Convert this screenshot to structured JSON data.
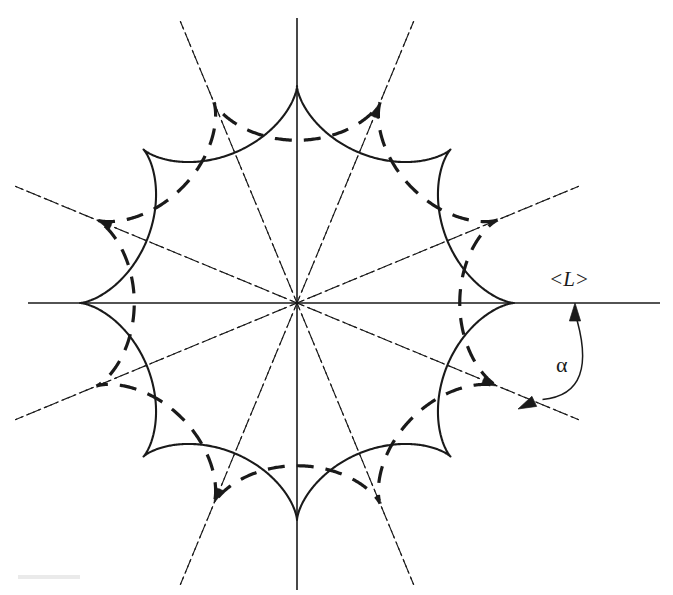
{
  "figure": {
    "background_color": "#ffffff",
    "stroke_color": "#1a1a1a",
    "center": {
      "x": 297,
      "y": 303
    },
    "labels": {
      "mean_length": "<L>",
      "angle": "α"
    },
    "label_positions": {
      "mean_length": {
        "x": 549,
        "y": 267
      },
      "angle": {
        "x": 556,
        "y": 352
      }
    },
    "axes": {
      "horizontal": {
        "x1": 28,
        "y1": 303,
        "x2": 660,
        "y2": 303,
        "style": "solid"
      },
      "vertical": {
        "x1": 297,
        "y1": 18,
        "x2": 297,
        "y2": 590,
        "style": "solid"
      }
    },
    "angle_arc": {
      "label": "α",
      "from_deg": 0,
      "to_deg": -22.5,
      "radius": 108,
      "arrow_head_start": {
        "x": 575,
        "y": 303
      },
      "arrow_head_end": {
        "x": 518,
        "y": 409
      }
    }
  },
  "chart_data": {
    "type": "line",
    "xlabel": "",
    "ylabel": "",
    "grid": false,
    "legend_position": "none",
    "annotations": [
      {
        "text": "<L>",
        "x": 549,
        "y": 267,
        "note": "mean length label on horizontal axis"
      },
      {
        "text": "α",
        "x": 556,
        "y": 352,
        "note": "angle between horizontal axis and dash-dot ray"
      }
    ],
    "series": [
      {
        "name": "solid-star",
        "style": "solid",
        "curve": "hypocycloid",
        "cusps": 8,
        "radius": 217,
        "rotation_deg": 0,
        "stroke_width": 2.1,
        "cusp_angles_deg": [
          0,
          45,
          90,
          135,
          180,
          225,
          270,
          315
        ],
        "cusp_points": [
          {
            "x": 514,
            "y": 303
          },
          {
            "x": 450,
            "y": 149
          },
          {
            "x": 297,
            "y": 86
          },
          {
            "x": 144,
            "y": 149
          },
          {
            "x": 80,
            "y": 303
          },
          {
            "x": 144,
            "y": 457
          },
          {
            "x": 297,
            "y": 520
          },
          {
            "x": 450,
            "y": 457
          }
        ]
      },
      {
        "name": "dashed-star",
        "style": "dashed",
        "curve": "hypocycloid",
        "cusps": 8,
        "radius": 217,
        "rotation_deg": 22.5,
        "stroke_width": 3.2,
        "dash_pattern": "17 12",
        "cusp_angles_deg": [
          22.5,
          67.5,
          112.5,
          157.5,
          202.5,
          247.5,
          292.5,
          337.5
        ],
        "cusp_points": [
          {
            "x": 497,
            "y": 220
          },
          {
            "x": 380,
            "y": 103
          },
          {
            "x": 214,
            "y": 103
          },
          {
            "x": 97,
            "y": 220
          },
          {
            "x": 97,
            "y": 386
          },
          {
            "x": 214,
            "y": 503
          },
          {
            "x": 380,
            "y": 503
          },
          {
            "x": 497,
            "y": 386
          }
        ]
      },
      {
        "name": "dashdot-rays",
        "style": "dashdot",
        "count": 8,
        "stroke_width": 1.15,
        "dash_pattern": "9 4 2 4",
        "ray_angles_deg": [
          22.5,
          67.5,
          112.5,
          157.5,
          202.5,
          247.5,
          292.5,
          337.5
        ],
        "ray_length": 305
      }
    ],
    "axis_lines": [
      {
        "name": "x-axis",
        "angle_deg": 0,
        "style": "solid",
        "stroke_width": 1.5
      },
      {
        "name": "y-axis",
        "angle_deg": 90,
        "style": "solid",
        "stroke_width": 1.5
      }
    ]
  }
}
